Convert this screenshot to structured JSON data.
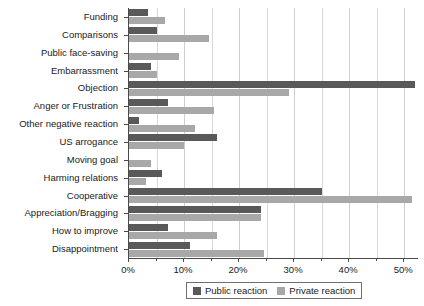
{
  "chart_data": {
    "type": "bar",
    "orientation": "horizontal",
    "title": "",
    "xlabel": "",
    "ylabel": "",
    "xlim": [
      0,
      52.7
    ],
    "xtick_labels": [
      "0%",
      "10%",
      "20%",
      "30%",
      "40%",
      "50%"
    ],
    "xtick_values": [
      0,
      10,
      20,
      30,
      40,
      50
    ],
    "xtick_minor_values": [
      5,
      15,
      25,
      35,
      45
    ],
    "grid": true,
    "legend_position": "bottom-center",
    "categories": [
      "Funding",
      "Comparisons",
      "Public face-saving",
      "Embarrassment",
      "Objection",
      "Anger or Frustration",
      "Other negative reaction",
      "US arrogance",
      "Moving goal",
      "Harming relations",
      "Cooperative",
      "Appreciation/Bragging",
      "How to improve",
      "Disappointment"
    ],
    "series": [
      {
        "name": "Public reaction",
        "color": "#595959",
        "values": [
          3.5,
          5.0,
          0.0,
          4.0,
          52.0,
          7.0,
          1.8,
          16.0,
          0.0,
          6.0,
          35.0,
          24.0,
          7.0,
          11.0
        ]
      },
      {
        "name": "Private reaction",
        "color": "#a8a8a8",
        "values": [
          6.5,
          14.5,
          9.0,
          5.0,
          29.0,
          15.5,
          12.0,
          10.0,
          4.0,
          3.0,
          51.5,
          24.0,
          16.0,
          24.5
        ]
      }
    ]
  }
}
